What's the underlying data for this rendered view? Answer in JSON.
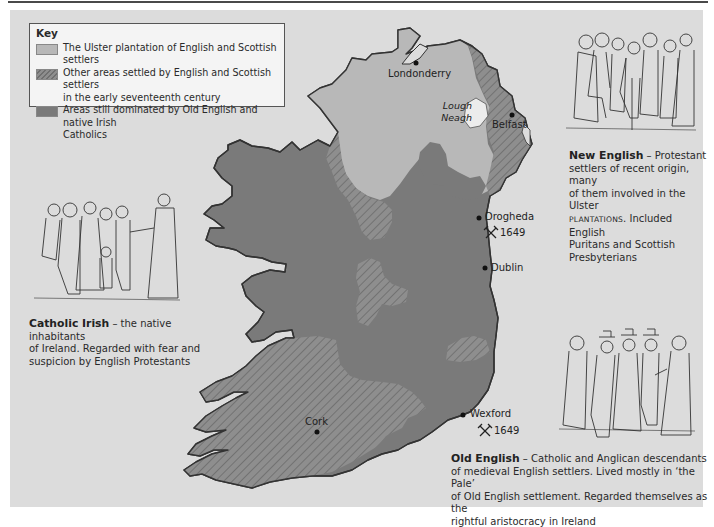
{
  "key": {
    "title": "Key",
    "items": [
      {
        "label_line1": "The Ulster plantation of English and Scottish settlers",
        "label_line2": "",
        "swatch": "light-grey-solid",
        "color": "#b8b8b8"
      },
      {
        "label_line1": "Other areas settled by English and Scottish settlers",
        "label_line2": "in the early seventeenth century",
        "swatch": "hatched-grey",
        "color": "#8e8e8e"
      },
      {
        "label_line1": "Areas still dominated by Old English and native Irish",
        "label_line2": "Catholics",
        "swatch": "dark-grey-solid",
        "color": "#7a7a7a"
      }
    ]
  },
  "places": {
    "londonderry": "Londonderry",
    "lough_line1": "Lough",
    "lough_line2": "Neagh",
    "belfast": "Belfast",
    "drogheda": "Drogheda",
    "drogheda_battle": "1649",
    "dublin": "Dublin",
    "wexford": "Wexford",
    "wexford_battle": "1649",
    "cork": "Cork"
  },
  "captions": {
    "new_english": {
      "title": "New English",
      "dash": " – ",
      "line1_rest": "Protestant",
      "line2": "settlers of recent origin, many",
      "line3": "of them involved in the Ulster",
      "line4_smallcaps": "PLANTATIONS",
      "line4_rest": ". Included English",
      "line5": "Puritans and Scottish",
      "line6": "Presbyterians"
    },
    "catholic_irish": {
      "title": "Catholic Irish",
      "dash": " – ",
      "line1_rest": "the native inhabitants",
      "line2": "of Ireland. Regarded with fear and",
      "line3": "suspicion by English Protestants"
    },
    "old_english": {
      "title": "Old English",
      "dash": " – ",
      "line1_rest": "Catholic and Anglican descendants",
      "line2": "of medieval English settlers. Lived mostly in ‘the Pale’",
      "line3": "of Old English settlement. Regarded themselves as the",
      "line4": "rightful aristocracy in Ireland"
    }
  },
  "colors": {
    "panel_bg": "#dcdcdc",
    "sea_bg": "#dcdcdc",
    "ulster": "#b8b8b8",
    "catholic": "#7a7a7a",
    "hatched_base": "#8e8e8e",
    "lough": "#ececec"
  }
}
